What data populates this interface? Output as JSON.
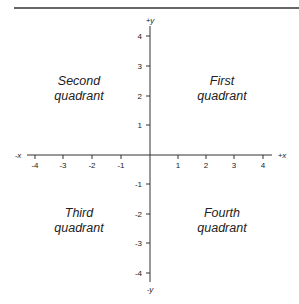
{
  "diagram": {
    "axes": {
      "x_positive_label": "+x",
      "x_negative_label": "-x",
      "y_positive_label": "+y",
      "y_negative_label": "-y",
      "x_ticks": [
        "-4",
        "-3",
        "-2",
        "-1",
        "1",
        "2",
        "3",
        "4"
      ],
      "y_ticks": [
        "4",
        "3",
        "2",
        "1",
        "-1",
        "-2",
        "-3",
        "-4"
      ]
    },
    "quadrants": {
      "first": {
        "line1": "First",
        "line2": "quadrant"
      },
      "second": {
        "line1": "Second",
        "line2": "quadrant"
      },
      "third": {
        "line1": "Third",
        "line2": "quadrant"
      },
      "fourth": {
        "line1": "Fourth",
        "line2": "quadrant"
      }
    },
    "colors": {
      "line": "#333333",
      "text": "#222222",
      "background": "#ffffff"
    }
  }
}
